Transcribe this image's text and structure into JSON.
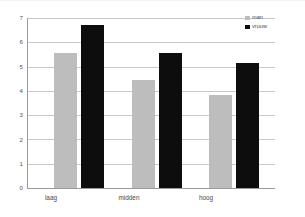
{
  "chart_data": {
    "type": "bar",
    "title": "",
    "subtitle": "",
    "xlabel": "",
    "ylabel": "",
    "categories": [
      "laag",
      "midden",
      "hoog"
    ],
    "series": [
      {
        "name": "man",
        "color": "#bdbdbd",
        "values": [
          5.55,
          4.45,
          3.85
        ]
      },
      {
        "name": "vrouw",
        "color": "#0d0d0d",
        "values": [
          6.7,
          5.55,
          5.15
        ]
      }
    ],
    "ylim": [
      0,
      7
    ],
    "ytick_labels": [
      "0",
      "1",
      "2",
      "3",
      "4",
      "5",
      "6",
      "7"
    ],
    "ytick_values": [
      0,
      1,
      2,
      3,
      4,
      5,
      6,
      7
    ],
    "grid": true,
    "grid_axis": "y",
    "legend_position": "top-right",
    "annotations": [],
    "background_color": "#ffffff",
    "axis_color": "#9a9a9a",
    "gridline_color": "#c9c9c9"
  },
  "legend": {
    "entries": [
      {
        "label": "man",
        "swatch": "legend-swatch-grey"
      },
      {
        "label": "vrouw",
        "swatch": "legend-swatch-black"
      }
    ]
  }
}
